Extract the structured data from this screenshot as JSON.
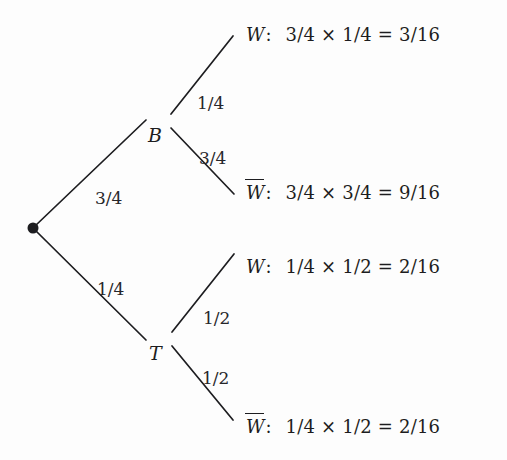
{
  "diagram": {
    "type": "probability-tree",
    "root": {
      "name": "root-node",
      "x": 33,
      "y": 228
    },
    "nodes": [
      {
        "id": "B",
        "label": "B",
        "x": 148,
        "y": 126
      },
      {
        "id": "T",
        "label": "T",
        "x": 149,
        "y": 344
      }
    ],
    "edges": [
      {
        "from": "root",
        "to": "B",
        "label": "3/4",
        "lx": 95,
        "ly": 190,
        "x1": 35,
        "y1": 226,
        "x2": 146,
        "y2": 120
      },
      {
        "from": "root",
        "to": "T",
        "label": "1/4",
        "lx": 97,
        "ly": 281,
        "x1": 35,
        "y1": 230,
        "x2": 146,
        "y2": 340
      },
      {
        "from": "B",
        "to": "W1",
        "label": "1/4",
        "lx": 197,
        "ly": 95,
        "x1": 171,
        "y1": 114,
        "x2": 233,
        "y2": 36
      },
      {
        "from": "B",
        "to": "W2",
        "label": "3/4",
        "lx": 199,
        "ly": 150,
        "x1": 171,
        "y1": 128,
        "x2": 234,
        "y2": 194
      },
      {
        "from": "T",
        "to": "W3",
        "label": "1/2",
        "lx": 203,
        "ly": 310,
        "x1": 172,
        "y1": 332,
        "x2": 234,
        "y2": 254
      },
      {
        "from": "T",
        "to": "W4",
        "label": "1/2",
        "lx": 202,
        "ly": 370,
        "x1": 172,
        "y1": 346,
        "x2": 233,
        "y2": 420
      }
    ],
    "outcomes": [
      {
        "id": "W1",
        "name": "W",
        "overline": false,
        "colon": ":",
        "expression": "3/4 × 1/4 = 3/16",
        "x": 246,
        "y": 26
      },
      {
        "id": "W2",
        "name": "W",
        "overline": true,
        "colon": ":",
        "expression": "3/4 × 3/4 = 9/16",
        "x": 246,
        "y": 184
      },
      {
        "id": "W3",
        "name": "W",
        "overline": false,
        "colon": ":",
        "expression": "1/4 × 1/2 = 2/16",
        "x": 246,
        "y": 258
      },
      {
        "id": "W4",
        "name": "W",
        "overline": true,
        "colon": ":",
        "expression": "1/4 × 1/2 = 2/16",
        "x": 246,
        "y": 418
      }
    ],
    "colors": {
      "line": "#1d1d20",
      "text": "#1d1d20",
      "background": "#fdfdfd"
    }
  },
  "chart_data": {
    "type": "diagram",
    "subtype": "probability-tree",
    "levels": [
      {
        "level": 1,
        "branches": [
          {
            "label": "B",
            "probability": "3/4"
          },
          {
            "label": "T",
            "probability": "1/4"
          }
        ]
      },
      {
        "level": 2,
        "branches": [
          {
            "parent": "B",
            "label": "W",
            "probability": "1/4"
          },
          {
            "parent": "B",
            "label": "W̅",
            "probability": "3/4"
          },
          {
            "parent": "T",
            "label": "W",
            "probability": "1/2"
          },
          {
            "parent": "T",
            "label": "W̅",
            "probability": "1/2"
          }
        ]
      }
    ],
    "outcomes": [
      {
        "path": "B,W",
        "calculation": "3/4 × 1/4",
        "result": "3/16"
      },
      {
        "path": "B,W̅",
        "calculation": "3/4 × 3/4",
        "result": "9/16"
      },
      {
        "path": "T,W",
        "calculation": "1/4 × 1/2",
        "result": "2/16"
      },
      {
        "path": "T,W̅",
        "calculation": "1/4 × 1/2",
        "result": "2/16"
      }
    ]
  }
}
